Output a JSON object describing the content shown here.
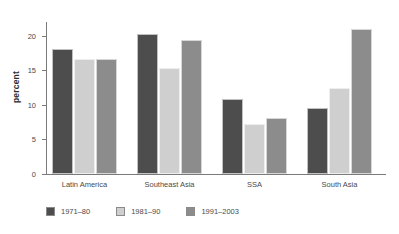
{
  "chart_data": {
    "type": "bar",
    "title": "",
    "subtitle": "",
    "xlabel": "",
    "ylabel": "percent",
    "ylim": [
      0,
      22
    ],
    "yticks": [
      0,
      5,
      10,
      15,
      20
    ],
    "ytick_labels": [
      "0",
      "5",
      "10",
      "15",
      "20"
    ],
    "grid": false,
    "legend_position": "bottom-left",
    "categories": [
      "Latin America",
      "Southeast Asia",
      "SSA",
      "South Asia"
    ],
    "series": [
      {
        "name": "1971–80",
        "color": "#4d4d4d",
        "values": [
          18.1,
          20.3,
          10.8,
          9.6
        ]
      },
      {
        "name": "1981–90",
        "color": "#cfcfcf",
        "values": [
          16.6,
          15.3,
          7.2,
          12.4
        ]
      },
      {
        "name": "1991–2003",
        "color": "#8c8c8c",
        "values": [
          16.7,
          19.4,
          8.1,
          21.0
        ]
      }
    ],
    "axis_color": "#7a7a7a"
  }
}
